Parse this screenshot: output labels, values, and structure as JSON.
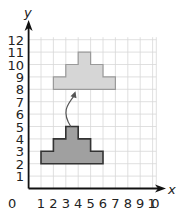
{
  "diagram": {
    "type": "coordinate-grid-translation",
    "axes": {
      "x_label": "x",
      "y_label": "y",
      "origin_label": "0",
      "x_ticks": [
        "1",
        "2",
        "3",
        "4",
        "5",
        "6",
        "7",
        "8",
        "9",
        "10"
      ],
      "y_ticks": [
        "1",
        "2",
        "3",
        "4",
        "5",
        "6",
        "7",
        "8",
        "9",
        "10",
        "11",
        "12"
      ],
      "x_range": [
        0,
        10
      ],
      "y_range": [
        0,
        12
      ]
    },
    "shapes": [
      {
        "name": "original-shape",
        "fill": "#a0a0a0",
        "stroke": "#333333",
        "vertices": [
          [
            1,
            2
          ],
          [
            6,
            2
          ],
          [
            6,
            3
          ],
          [
            5,
            3
          ],
          [
            5,
            4
          ],
          [
            4,
            4
          ],
          [
            4,
            5
          ],
          [
            3,
            5
          ],
          [
            3,
            4
          ],
          [
            2,
            4
          ],
          [
            2,
            3
          ],
          [
            1,
            3
          ]
        ]
      },
      {
        "name": "translated-image",
        "fill": "#d6d6d6",
        "stroke": "#9a9a9a",
        "vertices": [
          [
            2,
            8
          ],
          [
            7,
            8
          ],
          [
            7,
            9
          ],
          [
            6,
            9
          ],
          [
            6,
            10
          ],
          [
            5,
            10
          ],
          [
            5,
            11
          ],
          [
            4,
            11
          ],
          [
            4,
            10
          ],
          [
            3,
            10
          ],
          [
            3,
            9
          ],
          [
            2,
            9
          ]
        ]
      }
    ],
    "translation_arrow": {
      "from": [
        3.4,
        5
      ],
      "to": [
        3.7,
        8
      ]
    },
    "colors": {
      "grid": "#d8d8d8",
      "axis": "#111111",
      "arrow": "#555555"
    }
  }
}
